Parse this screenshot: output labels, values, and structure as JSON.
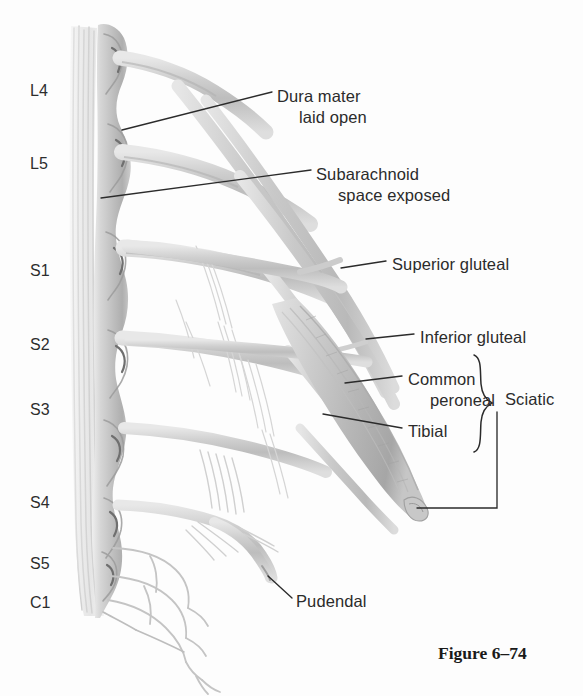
{
  "figure": {
    "caption": "Figure 6–74",
    "caption_x": 438,
    "caption_y": 643,
    "background_color": "#fdfdfd",
    "nerve_color": "#d2d2d2",
    "nerve_shadow_color": "#b4b4b4",
    "leader_color": "#2b2b2b",
    "text_color": "#2b2b2b"
  },
  "spinal_levels": [
    {
      "label": "L4",
      "x": 30,
      "y": 82
    },
    {
      "label": "L5",
      "x": 30,
      "y": 155
    },
    {
      "label": "S1",
      "x": 30,
      "y": 262
    },
    {
      "label": "S2",
      "x": 30,
      "y": 336
    },
    {
      "label": "S3",
      "x": 30,
      "y": 401
    },
    {
      "label": "S4",
      "x": 30,
      "y": 494
    },
    {
      "label": "S5",
      "x": 30,
      "y": 555
    },
    {
      "label": "C1",
      "x": 30,
      "y": 594
    }
  ],
  "annotations": [
    {
      "name": "dura-mater-laid-open",
      "lines": [
        "Dura mater",
        "laid open"
      ],
      "x": 277,
      "y": 86,
      "leader": {
        "x1": 272,
        "y1": 92,
        "x2": 122,
        "y2": 130
      }
    },
    {
      "name": "subarachnoid-space-exposed",
      "lines": [
        "Subarachnoid",
        "space exposed"
      ],
      "x": 316,
      "y": 164,
      "leader": {
        "x1": 311,
        "y1": 170,
        "x2": 101,
        "y2": 198
      }
    },
    {
      "name": "superior-gluteal",
      "lines": [
        "Superior gluteal"
      ],
      "x": 392,
      "y": 254,
      "leader": {
        "x1": 386,
        "y1": 261,
        "x2": 341,
        "y2": 268
      }
    },
    {
      "name": "inferior-gluteal",
      "lines": [
        "Inferior gluteal"
      ],
      "x": 420,
      "y": 327,
      "leader": {
        "x1": 414,
        "y1": 334,
        "x2": 366,
        "y2": 339
      }
    },
    {
      "name": "common-peroneal",
      "lines": [
        "Common",
        "peroneal"
      ],
      "x": 408,
      "y": 369,
      "leader": {
        "x1": 402,
        "y1": 376,
        "x2": 345,
        "y2": 383
      }
    },
    {
      "name": "tibial",
      "lines": [
        "Tibial"
      ],
      "x": 408,
      "y": 421,
      "leader": {
        "x1": 402,
        "y1": 428,
        "x2": 323,
        "y2": 414
      }
    },
    {
      "name": "sciatic",
      "lines": [
        "Sciatic"
      ],
      "x": 505,
      "y": 389,
      "leader_path": "M 497 412 L 497 508 L 417 508"
    },
    {
      "name": "pudendal",
      "lines": [
        "Pudendal"
      ],
      "x": 296,
      "y": 591,
      "leader": {
        "x1": 292,
        "y1": 598,
        "x2": 268,
        "y2": 576
      }
    }
  ],
  "brace": {
    "name": "sciatic-brace",
    "top_y": 355,
    "bottom_y": 452,
    "x": 480,
    "groups": [
      "Common peroneal",
      "Tibial"
    ],
    "label": "Sciatic"
  }
}
